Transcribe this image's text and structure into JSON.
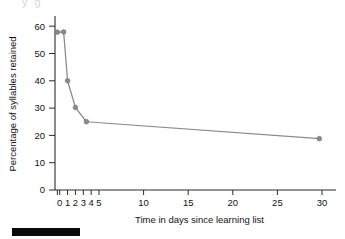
{
  "figure": {
    "cropped_title_fragment": "y g",
    "footer_bar": {
      "label": "black-rule",
      "color": "#0a0a0a",
      "x": 12,
      "y": 228,
      "width": 68,
      "height": 8
    }
  },
  "chart_data": {
    "type": "line",
    "title": "",
    "xlabel": "Time in days since learning list",
    "ylabel": "Percentage of syllables retained",
    "xlim": [
      -0.6,
      31
    ],
    "ylim": [
      0,
      63
    ],
    "grid": false,
    "legend": null,
    "marker": "circle",
    "line_color": "#8a8a8a",
    "marker_color": "#8a8a8a",
    "axis_color": "#2b2b2b",
    "x": [
      -0.3,
      0.5,
      1,
      2,
      3.4,
      29.7
    ],
    "y": [
      57.8,
      57.9,
      40.0,
      30.2,
      25.0,
      18.8
    ],
    "points": [
      {
        "x": -0.3,
        "y": 57.8,
        "x_label": "0",
        "y_label": "57.8"
      },
      {
        "x": 0.5,
        "y": 57.9,
        "x_label": "0.5",
        "y_label": "57.9"
      },
      {
        "x": 1,
        "y": 40.0,
        "x_label": "1",
        "y_label": "40"
      },
      {
        "x": 2,
        "y": 30.2,
        "x_label": "2",
        "y_label": "30"
      },
      {
        "x": 3.4,
        "y": 25.0,
        "x_label": "3.4",
        "y_label": "25"
      },
      {
        "x": 29.7,
        "y": 18.8,
        "x_label": "30",
        "y_label": "19"
      }
    ],
    "yticks": [
      0,
      10,
      20,
      30,
      40,
      50,
      60
    ],
    "ytick_labels": [
      "0",
      "10",
      "20",
      "30",
      "40",
      "50",
      "60"
    ],
    "xticks": [
      0,
      1,
      2,
      3,
      4,
      5,
      10,
      15,
      20,
      25,
      30
    ],
    "xtick_labels": [
      "0",
      "1",
      "2",
      "3",
      "4",
      "5",
      "10",
      "15",
      "20",
      "25",
      "30"
    ],
    "xticks_minor": [
      -0.3
    ]
  }
}
